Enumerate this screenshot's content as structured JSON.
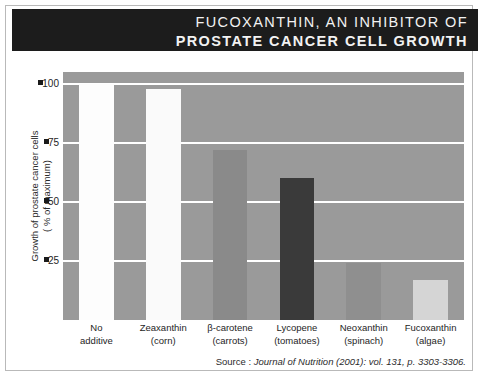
{
  "title": {
    "line1": "FUCOXANTHIN, AN INHIBITOR OF",
    "line2": "PROSTATE CANCER CELL GROWTH"
  },
  "source": {
    "label": "Source : ",
    "citation": "Journal of Nutrition (2001): vol. 131, p. 3303-3306."
  },
  "colors": {
    "banner_background": "#1c1c1c",
    "banner_text": "#f2f2f2",
    "plot_background": "#9a9a9a",
    "gridline": "#ffffff",
    "page_border": "#b9b9b9"
  },
  "chart_data": {
    "type": "bar",
    "title": "FUCOXANTHIN, AN INHIBITOR OF PROSTATE CANCER CELL GROWTH",
    "xlabel": "",
    "ylabel": "Growth of prostate cancer cells ( % of maximum)",
    "ylabel_line1": "Growth of prostate cancer cells",
    "ylabel_line2": "( % of maximum)",
    "ylim": [
      0,
      105
    ],
    "yticks": [
      25,
      50,
      75,
      100
    ],
    "ytick_labels": [
      "25",
      "50",
      "75",
      "100"
    ],
    "grid": true,
    "legend": "none",
    "categories": [
      "No additive",
      "Zeaxanthin (corn)",
      "β-carotene (carrots)",
      "Lycopene (tomatoes)",
      "Neoxanthin (spinach)",
      "Fucoxanthin (algae)"
    ],
    "category_lines": [
      [
        "No",
        "additive"
      ],
      [
        "Zeaxanthin",
        "(corn)"
      ],
      [
        "β-carotene",
        "(carrots)"
      ],
      [
        "Lycopene",
        "(tomatoes)"
      ],
      [
        "Neoxanthin",
        "(spinach)"
      ],
      [
        "Fucoxanthin",
        "(algae)"
      ]
    ],
    "values": [
      100,
      98,
      72,
      60,
      24,
      17
    ],
    "bar_colors": [
      "#fdfdfd",
      "#fafafa",
      "#8a8a8a",
      "#3a3a3a",
      "#8f8f8f",
      "#d5d5d5"
    ]
  }
}
